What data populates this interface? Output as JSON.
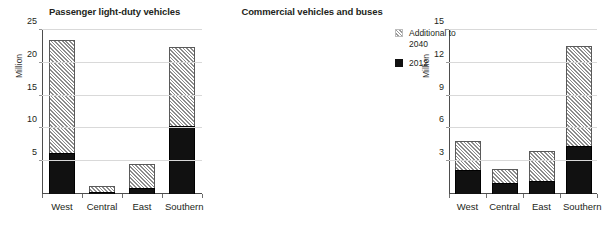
{
  "legend": {
    "position": "right",
    "items": [
      {
        "label": "Additional to 2040",
        "swatch": "hatched-diagonal",
        "color": "#e3e3e3"
      },
      {
        "label": "2012",
        "swatch": "solid",
        "color": "#111111"
      }
    ]
  },
  "charts": [
    {
      "id": "passenger-light-duty-vehicles",
      "title": "Passenger light-duty vehicles",
      "ylabel": "Million",
      "ticks": [
        "5",
        "10",
        "15",
        "20",
        "25"
      ],
      "categories": [
        "West",
        "Central",
        "East",
        "Southern"
      ]
    },
    {
      "id": "commercial-vehicles-and-buses",
      "title": "Commercial vehicles and buses",
      "ylabel": "Million",
      "ticks": [
        "3",
        "6",
        "9",
        "12",
        "15"
      ],
      "categories": [
        "West",
        "Central",
        "East",
        "Southern"
      ]
    }
  ],
  "chart_data": [
    {
      "type": "bar",
      "stacked": true,
      "title": "Passenger light-duty vehicles",
      "xlabel": "",
      "ylabel": "Million",
      "ylim": [
        0,
        25
      ],
      "yticks": [
        5,
        10,
        15,
        20,
        25
      ],
      "grid": true,
      "legend_position": "right",
      "categories": [
        "West",
        "Central",
        "East",
        "Southern"
      ],
      "series": [
        {
          "name": "2012",
          "values": [
            6.3,
            0.3,
            0.9,
            10.3
          ]
        },
        {
          "name": "Additional to 2040",
          "values": [
            17.2,
            0.9,
            3.7,
            12.1
          ]
        }
      ],
      "totals": [
        23.5,
        1.2,
        4.6,
        22.4
      ]
    },
    {
      "type": "bar",
      "stacked": true,
      "title": "Commercial vehicles and buses",
      "xlabel": "",
      "ylabel": "Million",
      "ylim": [
        0,
        15
      ],
      "yticks": [
        3,
        6,
        9,
        12,
        15
      ],
      "grid": true,
      "legend_position": "right",
      "categories": [
        "West",
        "Central",
        "East",
        "Southern"
      ],
      "series": [
        {
          "name": "2012",
          "values": [
            2.2,
            1.0,
            1.2,
            4.4
          ]
        },
        {
          "name": "Additional to 2040",
          "values": [
            2.65,
            1.25,
            2.7,
            9.1
          ]
        }
      ],
      "totals": [
        4.85,
        2.25,
        3.9,
        13.5
      ]
    }
  ]
}
